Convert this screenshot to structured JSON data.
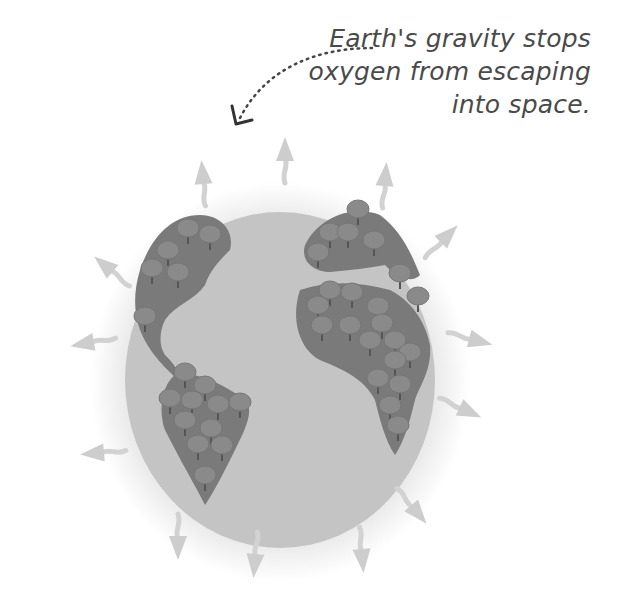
{
  "caption": {
    "lines": [
      "Earth's gravity stops",
      "oxygen from escaping",
      "into space."
    ]
  },
  "illustration": {
    "subject": "earth-globe",
    "elements": [
      "atmosphere-halo",
      "globe",
      "continents-with-trees",
      "oxygen-arrows",
      "dotted-pointer-arrow"
    ],
    "arrow_count": 15
  },
  "colors": {
    "background": "#ffffff",
    "atmosphere": "#ececec",
    "globe": "#c4c4c4",
    "continent": "#7a7a7a",
    "tree_canopy": "#8e8e8e",
    "arrow": "#cfcfcf",
    "text": "#4a4a4a"
  }
}
